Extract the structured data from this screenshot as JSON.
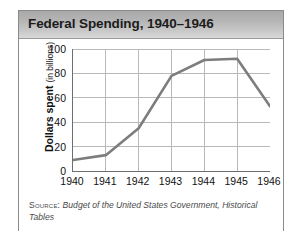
{
  "figure": {
    "title": "Federal Spending, 1940–1946",
    "source_label": "Source:",
    "source_text": "Budget of the United States Government, Historical Tables"
  },
  "chart_data": {
    "type": "line",
    "title": "Federal Spending, 1940–1946",
    "xlabel": "",
    "ylabel": "Dollars spent",
    "ylabel_unit": "(in billions)",
    "categories": [
      "1940",
      "1941",
      "1942",
      "1943",
      "1944",
      "1945",
      "1946"
    ],
    "values": [
      9,
      13,
      35,
      78,
      91,
      92,
      53
    ],
    "series": [
      {
        "name": "Federal Spending",
        "values": [
          9,
          13,
          35,
          78,
          91,
          92,
          53
        ]
      }
    ],
    "ylim": [
      0,
      100
    ],
    "yticks": [
      0,
      20,
      40,
      60,
      80,
      100
    ],
    "xticks": [
      "1940",
      "1941",
      "1942",
      "1943",
      "1944",
      "1945",
      "1946"
    ],
    "grid": true,
    "grid_axis": "both",
    "legend": false,
    "line_color": "#7d7d7d",
    "grid_color": "#b9b9b9",
    "axis_color": "#6e6e6e"
  }
}
